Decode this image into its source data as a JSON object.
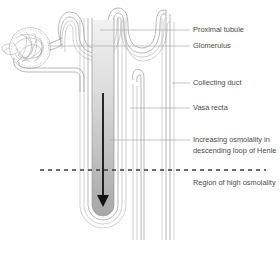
{
  "diagram": {
    "background_color": "#ffffff",
    "line_color": "#9a9a9a",
    "text_color": "#4a4a4a",
    "arrow_color": "#111111",
    "dash_color": "#3c3c3c"
  },
  "labels": [
    {
      "id": "proximal-tubule",
      "text": "Proximal tubule",
      "x": 193,
      "y": 30,
      "leader_from_x": 100,
      "leader_to_x": 190,
      "leader_y": 30
    },
    {
      "id": "glomerulus",
      "text": "Glomerulus",
      "x": 193,
      "y": 46,
      "leader_from_x": 48,
      "leader_to_x": 190,
      "leader_y": 46
    },
    {
      "id": "collecting-duct",
      "text": "Collecting duct",
      "x": 193,
      "y": 83,
      "leader_from_x": 172,
      "leader_to_x": 190,
      "leader_y": 83
    },
    {
      "id": "vasa-recta",
      "text": "Vasa recta",
      "x": 193,
      "y": 108,
      "leader_from_x": 130,
      "leader_to_x": 190,
      "leader_y": 108
    },
    {
      "id": "increasing-osmolality",
      "text": "Increasing osmolality in",
      "x": 193,
      "y": 140,
      "leader_from_x": 110,
      "leader_to_x": 190,
      "leader_y": 140
    },
    {
      "id": "increasing-osmolality-line2",
      "text": "descending loop of Henle",
      "x": 193,
      "y": 151,
      "leader_from_x": null,
      "leader_to_x": null,
      "leader_y": null
    },
    {
      "id": "region-high-osmolality",
      "text": "Region of high osmolality",
      "x": 193,
      "y": 183,
      "leader_from_x": null,
      "leader_to_x": null,
      "leader_y": null
    }
  ],
  "dashed_divider": {
    "x1": 40,
    "x2": 266,
    "y": 170
  },
  "flow_arrow": {
    "x": 103,
    "y_start": 93,
    "y_end": 205,
    "direction": "down"
  },
  "structures": [
    {
      "id": "glomerulus-ball",
      "label": "Glomerulus",
      "cx": 30,
      "cy": 48,
      "r": 20
    },
    {
      "id": "proximal-convoluted-tubule",
      "label": "Proximal tubule"
    },
    {
      "id": "loop-of-henle",
      "label": "Loop of Henle"
    },
    {
      "id": "distal-convoluted-tubule",
      "label": "Distal tubule"
    },
    {
      "id": "collecting-duct-tube",
      "label": "Collecting duct"
    },
    {
      "id": "vasa-recta-tube",
      "label": "Vasa recta"
    }
  ]
}
